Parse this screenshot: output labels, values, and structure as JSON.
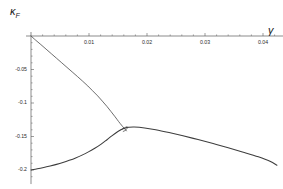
{
  "chart_data": {
    "type": "line",
    "title": "",
    "xlabel": "γ",
    "ylabel": "κ_F",
    "ylabel_base": "κ",
    "ylabel_sub": "F",
    "xlim": [
      0.0,
      0.0435
    ],
    "ylim": [
      -0.215,
      0.003
    ],
    "grid": false,
    "legend": "none",
    "xticks": [
      0.01,
      0.02,
      0.03,
      0.04
    ],
    "xtick_labels": [
      "0.01",
      "0.02",
      "0.03",
      "0.04"
    ],
    "yticks": [
      -0.05,
      -0.1,
      -0.15,
      -0.2
    ],
    "ytick_labels": [
      "-0.05",
      "-0.1",
      "-0.15",
      "-0.2"
    ],
    "line_color": "#3d3d3d",
    "axis_color": "#5a5a5a",
    "series": [
      {
        "name": "upper-branch",
        "comment": "descends from origin to terminal point near the cusp",
        "x": [
          0.0,
          0.0008,
          0.0017,
          0.0026,
          0.0035,
          0.0044,
          0.0053,
          0.0062,
          0.0071,
          0.008,
          0.0089,
          0.0098,
          0.0106,
          0.0115,
          0.0123,
          0.0131,
          0.0138,
          0.0145,
          0.0151,
          0.0156,
          0.016,
          0.0163,
          0.01645
        ],
        "y": [
          0.0,
          -0.0062,
          -0.0128,
          -0.0196,
          -0.0264,
          -0.0332,
          -0.04,
          -0.0468,
          -0.0536,
          -0.0604,
          -0.0674,
          -0.0746,
          -0.0816,
          -0.0894,
          -0.0972,
          -0.1052,
          -0.1128,
          -0.1206,
          -0.1276,
          -0.133,
          -0.1372,
          -0.14,
          -0.1416
        ]
      },
      {
        "name": "lower-branch-rising",
        "comment": "rises from (0,-0.2) to the cusp peak",
        "x": [
          0.0,
          0.0011,
          0.0022,
          0.0033,
          0.0044,
          0.0055,
          0.0066,
          0.0077,
          0.0088,
          0.0099,
          0.011,
          0.0121,
          0.0131,
          0.014,
          0.0148,
          0.0155,
          0.016,
          0.0164,
          0.0167
        ],
        "y": [
          -0.2,
          -0.1982,
          -0.1962,
          -0.194,
          -0.1916,
          -0.1888,
          -0.1856,
          -0.182,
          -0.1778,
          -0.173,
          -0.1676,
          -0.1614,
          -0.1548,
          -0.1486,
          -0.1436,
          -0.14,
          -0.138,
          -0.1368,
          -0.1362
        ]
      },
      {
        "name": "lower-branch-falling",
        "comment": "nearly linear descent from the plateau to the right edge",
        "x": [
          0.0167,
          0.0178,
          0.0196,
          0.0215,
          0.0238,
          0.0262,
          0.0288,
          0.0314,
          0.034,
          0.0366,
          0.0392,
          0.0412,
          0.0424
        ],
        "y": [
          -0.1362,
          -0.1358,
          -0.1372,
          -0.14,
          -0.1442,
          -0.149,
          -0.1546,
          -0.1606,
          -0.1668,
          -0.1734,
          -0.1804,
          -0.187,
          -0.193
        ]
      },
      {
        "name": "cusp-swallowtail",
        "comment": "small fold/loop where the two branches meet",
        "x": [
          0.0155,
          0.0159,
          0.0163,
          0.01655,
          0.0166,
          0.01645,
          0.0162,
          0.0159
        ],
        "y": [
          -0.14,
          -0.1378,
          -0.1362,
          -0.1356,
          -0.1372,
          -0.1394,
          -0.1412,
          -0.1424
        ]
      }
    ]
  }
}
